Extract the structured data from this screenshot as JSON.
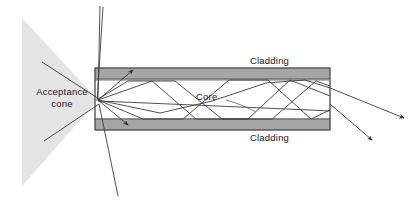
{
  "diagram": {
    "type": "optical-ray-diagram",
    "labels": {
      "cladding_top": "Cladding",
      "cladding_bottom": "Cladding",
      "core": "Core",
      "acceptance_line1": "Acceptance",
      "acceptance_line2": "cone"
    },
    "colors": {
      "background": "#ffffff",
      "cladding_fill": "#a6a6a6",
      "cladding_stroke": "#4d4d4d",
      "core_fill": "#ffffff",
      "core_stroke": "#555555",
      "cone_fill": "#e4e4e4",
      "ray_stroke": "#3c3c3c",
      "text": "#1a1a1a"
    },
    "geometry": {
      "fiber_left": 95,
      "fiber_right": 330,
      "fiber_top": 68,
      "fiber_bottom": 130,
      "cladding_thickness": 11,
      "core_top": 80,
      "core_bottom": 119,
      "cone_apex_x": 98,
      "cone_apex_y": 100,
      "cone_left_x": 22,
      "cone_top_y": 18,
      "cone_bottom_y": 186
    }
  }
}
